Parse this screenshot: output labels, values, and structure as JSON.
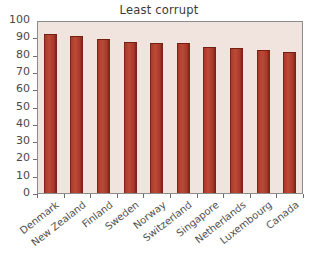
{
  "chart_data": {
    "type": "bar",
    "title": "Least corrupt",
    "xlabel": "",
    "ylabel": "",
    "categories": [
      "Denmark",
      "New Zealand",
      "Finland",
      "Sweden",
      "Norway",
      "Switzerland",
      "Singapore",
      "Netherlands",
      "Luxembourg",
      "Canada"
    ],
    "values": [
      92,
      91,
      89,
      87.5,
      86.5,
      86.5,
      84.5,
      84,
      82.5,
      81.5
    ],
    "ylim": [
      0,
      100
    ],
    "yticks": [
      0,
      10,
      20,
      30,
      40,
      50,
      60,
      70,
      80,
      90,
      100
    ],
    "ytick_labels": [
      "0",
      "10",
      "20",
      "30",
      "40",
      "50",
      "60",
      "70",
      "80",
      "90",
      "100"
    ],
    "grid": false,
    "legend": null,
    "series": [
      {
        "name": "Corruption Perceptions score",
        "values": [
          92,
          91,
          89,
          87.5,
          86.5,
          86.5,
          84.5,
          84,
          82.5,
          81.5
        ]
      }
    ]
  },
  "style": {
    "bar_color": "#a8382a",
    "bar_edge_color": "#72200f",
    "plot_background": "#f1e3dd",
    "frame_color": "#8c8c8c",
    "text_color": "#4a4a4a",
    "title_color": "#3a3a3a",
    "page_background": "#ffffff"
  }
}
